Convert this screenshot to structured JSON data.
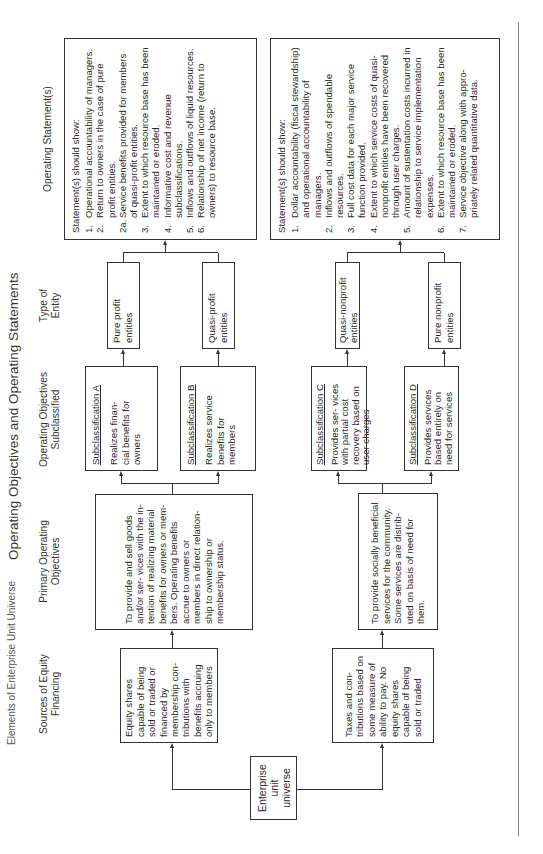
{
  "page": {
    "running_title": "Elements of Enterprise Unit Universe",
    "figure_title": "Operating Objectives and Operating Statements"
  },
  "columns": {
    "sources": "Sources of Equity\nFinancing",
    "primary": "Primary Operating\nObjectives",
    "subclassified": "Operating Objectives\nSubclassified",
    "entity_type": "Type of\nEntity",
    "statements": "Operating Statement(s)"
  },
  "root": {
    "label": "Enterprise\nunit\nuniverse"
  },
  "equity_sources": [
    {
      "text": "Equity shares capable of being sold or traded or financed by membership con- tributions with benefits accruing only to members"
    },
    {
      "text": "Taxes and con- tributions based on some measure of ability to pay. No equity shares capable of being sold or traded"
    }
  ],
  "primary_objectives": [
    {
      "text": "To provide and sell goods and/or ser- vices with the in- tention of realizing material benefits for owners or mem- bers. Operating benefits accrue to owners or members in direct relation- ship to ownership or membership status."
    },
    {
      "text": "To provide socially beneficial services for the community. Some services are distrib- uted on basis of need for them."
    }
  ],
  "subclassifications": [
    {
      "title": "Subclassification A",
      "text": "Realizes finan- cial benefits for owners"
    },
    {
      "title": "Subclassification B",
      "text": "Realizes service benefits for members"
    },
    {
      "title": "Subclassification C",
      "text": "Provides ser- vices with partial cost recovery based on user charges"
    },
    {
      "title": "Subclassification D",
      "text": "Provides services based entirely on need for services"
    }
  ],
  "entity_types": [
    {
      "label": "Pure profit\nentities"
    },
    {
      "label": "Quasi-profit\nentities"
    },
    {
      "label": "Quasi-nonprofit\nentities"
    },
    {
      "label": "Pure nonprofit\nentities"
    }
  ],
  "statements": [
    {
      "heading": "Statement(s) should show:",
      "items": [
        {
          "n": "1.",
          "t": "Operational accountability of managers."
        },
        {
          "n": "2.",
          "t": "Return to owners in the case of pure profit entities."
        },
        {
          "n": "2a.",
          "t": "Service benefits provided for members of quasi-profit entities."
        },
        {
          "n": "3.",
          "t": "Extent to which resource base has been maintained or eroded."
        },
        {
          "n": "4.",
          "t": "Informative cost and revenue subclassifications."
        },
        {
          "n": "5.",
          "t": "Inflows and outflows of liquid resources."
        },
        {
          "n": "6.",
          "t": "Relationship of net income (return to owners) to resource base."
        }
      ]
    },
    {
      "heading": "Statement(s) should show:",
      "items": [
        {
          "n": "1.",
          "t": "Dollar accountability (fiscal stewardship) and operational accountability of managers."
        },
        {
          "n": "2.",
          "t": "Inflows and outflows of spendable resources."
        },
        {
          "n": "3.",
          "t": "Full cost data for each major service function provided."
        },
        {
          "n": "4.",
          "t": "Extent to which service costs of quasi-nonprofit entities have been recovered through user charges."
        },
        {
          "n": "5.",
          "t": "Amount of sustentation costs incurred in relationship to service implementation expenses."
        },
        {
          "n": "6.",
          "t": "Extent to which resource base has been maintained or eroded."
        },
        {
          "n": "7.",
          "t": "Service objective along with appro- priately related quantitative data."
        }
      ]
    }
  ]
}
